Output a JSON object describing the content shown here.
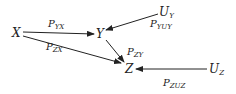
{
  "diagram": {
    "type": "path-diagram",
    "nodes": {
      "X": {
        "label": "X"
      },
      "Y": {
        "label": "Y"
      },
      "Z": {
        "label": "Z"
      },
      "UY": {
        "label": "U",
        "sub": "Y"
      },
      "UZ": {
        "label": "U",
        "sub": "Z"
      }
    },
    "edges": [
      {
        "from": "X",
        "to": "Y",
        "label": "P",
        "sub": "YX"
      },
      {
        "from": "X",
        "to": "Z",
        "label": "P",
        "sub": "ZX"
      },
      {
        "from": "UY",
        "to": "Y",
        "label": "P",
        "sub": "YUᵧ"
      },
      {
        "from": "Y",
        "to": "Z",
        "label": "P",
        "sub": "ZY"
      },
      {
        "from": "UZ",
        "to": "Z",
        "label": "P",
        "sub": "ZUᵩ"
      }
    ],
    "edge_labels_display": {
      "pyx": "YX",
      "pzx": "ZX",
      "pyuy": "YUY",
      "pzy": "ZY",
      "pzuz": "ZUZ"
    }
  }
}
